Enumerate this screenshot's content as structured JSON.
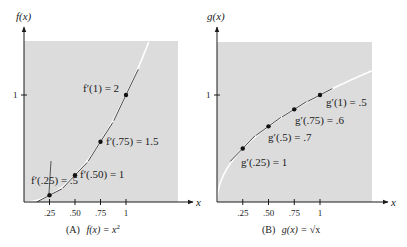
{
  "chart_data": [
    {
      "type": "line",
      "id": "A",
      "caption": "(A)",
      "caption_func": "f(x) = x",
      "caption_sup": "2",
      "ylabel": "f(x)",
      "xlabel": "x",
      "function": "x^2",
      "x_ticks": [
        ".25",
        ".50",
        ".75",
        "1"
      ],
      "x_tick_values": [
        0.25,
        0.5,
        0.75,
        1
      ],
      "y_ticks": [
        "1"
      ],
      "y_tick_values": [
        1
      ],
      "xlim": [
        0,
        1.5
      ],
      "ylim": [
        0,
        1.5
      ],
      "points": [
        {
          "x": 0.25,
          "y": 0.0625,
          "label": "f′(.25) = .5",
          "slope": 0.5
        },
        {
          "x": 0.5,
          "y": 0.25,
          "label": "f′(.50) = 1",
          "slope": 1
        },
        {
          "x": 0.75,
          "y": 0.5625,
          "label": "f′(.75) = 1.5",
          "slope": 1.5
        },
        {
          "x": 1,
          "y": 1,
          "label": "f′(1) = 2",
          "slope": 2
        }
      ]
    },
    {
      "type": "line",
      "id": "B",
      "caption": "(B)",
      "caption_func": "g(x) = ",
      "caption_sqrt": "√x",
      "ylabel": "g(x)",
      "xlabel": "x",
      "function": "sqrt(x)",
      "x_ticks": [
        ".25",
        ".50",
        ".75",
        "1"
      ],
      "x_tick_values": [
        0.25,
        0.5,
        0.75,
        1
      ],
      "y_ticks": [
        "1"
      ],
      "y_tick_values": [
        1
      ],
      "xlim": [
        0,
        1.5
      ],
      "ylim": [
        0,
        1.5
      ],
      "points": [
        {
          "x": 0.25,
          "y": 0.5,
          "label": "g′(.25) = 1",
          "slope": 1
        },
        {
          "x": 0.5,
          "y": 0.707,
          "label": "g′(.5) = .7",
          "slope": 0.7
        },
        {
          "x": 0.75,
          "y": 0.866,
          "label": "g′(.75) = .6",
          "slope": 0.6
        },
        {
          "x": 1,
          "y": 1,
          "label": "g′(1) = .5",
          "slope": 0.5
        }
      ]
    }
  ],
  "colors": {
    "shade": "#dcdcdc",
    "curve": "#ffffff",
    "tangent": "#1a1a1a",
    "axis": "#1a1a1a"
  }
}
